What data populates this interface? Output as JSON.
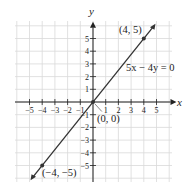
{
  "chart_data": {
    "type": "line",
    "title": "",
    "xlabel": "x",
    "ylabel": "y",
    "xlim": [
      -6,
      6
    ],
    "ylim": [
      -6,
      6
    ],
    "grid": true,
    "x_ticks": [
      -5,
      -4,
      -3,
      -2,
      -1,
      1,
      2,
      3,
      4,
      5
    ],
    "y_ticks": [
      -5,
      -4,
      -3,
      -2,
      -1,
      1,
      2,
      3,
      4,
      5
    ],
    "x_tick_labels": [
      "−5",
      "−4",
      "−3",
      "−2",
      "−1",
      "1",
      "2",
      "3",
      "4",
      "5"
    ],
    "y_tick_labels": [
      "−5",
      "−4",
      "−3",
      "−2",
      "−1",
      "1",
      "2",
      "3",
      "4",
      "5"
    ],
    "series": [
      {
        "name": "5x − 4y = 0",
        "equation": "5x - 4y = 0",
        "x": [
          -4.8,
          4.8
        ],
        "y": [
          -6,
          6
        ]
      }
    ],
    "points": [
      {
        "x": 4,
        "y": 5,
        "label": "(4, 5)"
      },
      {
        "x": 0,
        "y": 0,
        "label": "(0, 0)"
      },
      {
        "x": -4,
        "y": -5,
        "label": "(−4, −5)"
      }
    ],
    "annotations": [
      {
        "text": "5x − 4y = 0",
        "x": 3,
        "y": 2.6
      }
    ]
  },
  "labels": {
    "x_axis": "x",
    "y_axis": "y",
    "equation": "5x − 4y = 0",
    "point_a": "(4, 5)",
    "point_o": "(0, 0)",
    "point_b": "(−4, −5)"
  },
  "colors": {
    "grid": "#d9d9d9",
    "axis": "#222222",
    "line": "#333333"
  }
}
